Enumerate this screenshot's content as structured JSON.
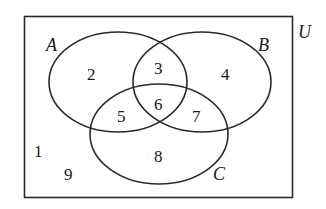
{
  "diagram": {
    "type": "venn",
    "universe_label": "U",
    "sets": [
      {
        "label": "A"
      },
      {
        "label": "B"
      },
      {
        "label": "C"
      }
    ],
    "regions": {
      "A_only": "2",
      "A_and_B_only": "3",
      "B_only": "4",
      "A_and_C_only": "5",
      "A_and_B_and_C": "6",
      "B_and_C_only": "7",
      "C_only": "8",
      "outside": [
        "1",
        "9"
      ]
    },
    "colors": {
      "stroke": "#2a2a2a",
      "background": "#ffffff"
    }
  }
}
